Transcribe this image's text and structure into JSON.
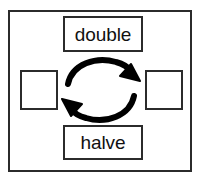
{
  "diagram": {
    "frame": {
      "name": "outer-frame",
      "stroke_color": "#2b2b2b"
    },
    "nodes": [
      {
        "id": "double",
        "label": "double",
        "position": "top",
        "stroke_color": "#2b2b2b",
        "fill_color": "#ffffff"
      },
      {
        "id": "left-value",
        "label": "",
        "position": "left",
        "stroke_color": "#2b2b2b",
        "fill_color": "#ffffff"
      },
      {
        "id": "right-value",
        "label": "",
        "position": "right",
        "stroke_color": "#2b2b2b",
        "fill_color": "#ffffff"
      },
      {
        "id": "halve",
        "label": "halve",
        "position": "bottom",
        "stroke_color": "#2b2b2b",
        "fill_color": "#ffffff"
      }
    ],
    "arrows": [
      {
        "id": "arrow-top",
        "icon": "curved-arrow-right-icon",
        "direction": "left-to-right",
        "operation_label": "double",
        "color": "#000000"
      },
      {
        "id": "arrow-bottom",
        "icon": "curved-arrow-left-icon",
        "direction": "right-to-left",
        "operation_label": "halve",
        "color": "#000000"
      }
    ]
  }
}
